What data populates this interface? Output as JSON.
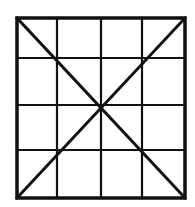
{
  "diagram": {
    "type": "grid-with-diagonals",
    "rows": 4,
    "cols": 4,
    "frame": {
      "x": 17,
      "y": 18,
      "width": 168,
      "height": 180
    },
    "vertical_lines_x": [
      17,
      57,
      101,
      142,
      185
    ],
    "horizontal_lines_y": [
      18,
      58,
      105,
      150,
      198
    ],
    "diagonals": [
      {
        "from": [
          17,
          18
        ],
        "to": [
          185,
          198
        ]
      },
      {
        "from": [
          185,
          18
        ],
        "to": [
          17,
          198
        ]
      }
    ],
    "stroke_color": "#111111",
    "border_width": 3.5,
    "grid_width": 2.2,
    "diagonal_width": 3,
    "background": "#ffffff"
  }
}
